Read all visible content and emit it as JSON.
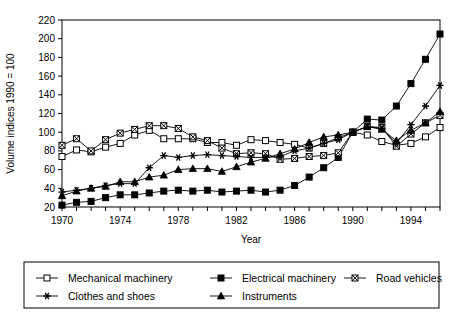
{
  "chart_data": {
    "type": "line",
    "title": "",
    "xlabel": "Year",
    "ylabel": "Volume indices 1990 = 100",
    "xlim": [
      1970,
      1996
    ],
    "ylim": [
      20,
      220
    ],
    "ytick_step": 20,
    "xtick_step": 1,
    "xticklabel_step": 4,
    "grid": false,
    "legend_position": "bottom",
    "yticks": [
      20,
      40,
      60,
      80,
      100,
      120,
      140,
      160,
      180,
      200,
      220
    ],
    "xticks": [
      1970,
      1971,
      1972,
      1973,
      1974,
      1975,
      1976,
      1977,
      1978,
      1979,
      1980,
      1981,
      1982,
      1983,
      1984,
      1985,
      1986,
      1987,
      1988,
      1989,
      1990,
      1991,
      1992,
      1993,
      1994,
      1995,
      1996
    ],
    "xticklabels": [
      "1970",
      "1974",
      "1978",
      "1982",
      "1986",
      "1990",
      "1994"
    ],
    "xticklabel_values": [
      1970,
      1974,
      1978,
      1982,
      1986,
      1990,
      1994
    ],
    "x": [
      1970,
      1971,
      1972,
      1973,
      1974,
      1975,
      1976,
      1977,
      1978,
      1979,
      1980,
      1981,
      1982,
      1983,
      1984,
      1985,
      1986,
      1987,
      1988,
      1989,
      1990,
      1991,
      1992,
      1993,
      1994,
      1995,
      1996
    ],
    "series": [
      {
        "name": "Mechanical machinery",
        "marker": "open-square",
        "values": [
          74,
          81,
          79,
          84,
          88,
          97,
          102,
          93,
          93,
          93,
          89,
          89,
          86,
          92,
          91,
          89,
          87,
          83,
          88,
          94,
          100,
          97,
          90,
          86,
          88,
          95,
          105
        ]
      },
      {
        "name": "Electrical machinery",
        "marker": "filled-square",
        "values": [
          22,
          25,
          26,
          30,
          33,
          33,
          35,
          37,
          38,
          37,
          38,
          36,
          37,
          38,
          36,
          38,
          43,
          52,
          62,
          73,
          100,
          114,
          113,
          128,
          152,
          178,
          205
        ]
      },
      {
        "name": "Road vehicles",
        "marker": "x-square",
        "values": [
          86,
          93,
          80,
          92,
          99,
          103,
          107,
          107,
          104,
          95,
          91,
          83,
          77,
          78,
          77,
          71,
          72,
          74,
          75,
          78,
          100,
          106,
          105,
          85,
          98,
          110,
          118
        ]
      },
      {
        "name": "Clothes and shoes",
        "marker": "asterisk",
        "values": [
          36,
          38,
          40,
          43,
          45,
          45,
          62,
          75,
          73,
          75,
          76,
          75,
          74,
          73,
          73,
          74,
          80,
          83,
          88,
          92,
          100,
          106,
          104,
          88,
          108,
          128,
          150
        ]
      },
      {
        "name": "Instruments",
        "marker": "filled-triangle",
        "values": [
          32,
          37,
          40,
          42,
          47,
          47,
          52,
          54,
          60,
          61,
          61,
          58,
          63,
          68,
          72,
          77,
          82,
          89,
          95,
          97,
          100,
          106,
          103,
          91,
          102,
          110,
          122
        ]
      }
    ]
  },
  "legend": {
    "entries": [
      {
        "label": "Mechanical machinery",
        "marker": "open-square"
      },
      {
        "label": "Electrical machinery",
        "marker": "filled-square"
      },
      {
        "label": "Road vehicles",
        "marker": "x-square"
      },
      {
        "label": "Clothes and shoes",
        "marker": "asterisk"
      },
      {
        "label": "Instruments",
        "marker": "filled-triangle"
      }
    ]
  },
  "colors": {
    "ink": "#000000",
    "background": "#ffffff"
  }
}
